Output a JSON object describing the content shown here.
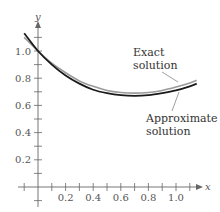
{
  "chart_data": {
    "type": "line",
    "title": "",
    "xlabel": "x",
    "ylabel": "y",
    "xlim": [
      -0.1,
      1.25
    ],
    "ylim": [
      -0.1,
      1.2
    ],
    "x_ticks": [
      0.2,
      0.4,
      0.6,
      0.8,
      1.0
    ],
    "x_tick_labels": [
      "0.2",
      "0.4",
      "0.6",
      "0.8",
      "1.0"
    ],
    "y_ticks": [
      0.2,
      0.4,
      0.6,
      0.8,
      1.0
    ],
    "y_tick_labels": [
      "0.2",
      "0.4",
      "0.6",
      "0.8",
      "1.0"
    ],
    "minor_tick_step": 0.1,
    "grid": false,
    "legend": null,
    "series": [
      {
        "name": "Exact solution",
        "color": "#9a9a9a",
        "x": [
          -0.1,
          0.0,
          0.1,
          0.2,
          0.3,
          0.4,
          0.5,
          0.6,
          0.7,
          0.8,
          0.9,
          1.0,
          1.1,
          1.15
        ],
        "y": [
          1.1,
          1.0,
          0.91,
          0.84,
          0.78,
          0.74,
          0.71,
          0.695,
          0.69,
          0.695,
          0.71,
          0.735,
          0.765,
          0.785
        ]
      },
      {
        "name": "Approximate solution",
        "color": "#1a1a1a",
        "x": [
          -0.1,
          0.0,
          0.1,
          0.2,
          0.3,
          0.4,
          0.5,
          0.6,
          0.7,
          0.8,
          0.9,
          1.0,
          1.1,
          1.15
        ],
        "y": [
          1.13,
          1.0,
          0.9,
          0.82,
          0.76,
          0.715,
          0.69,
          0.675,
          0.67,
          0.675,
          0.69,
          0.71,
          0.74,
          0.76
        ]
      }
    ],
    "annotations": [
      {
        "text_lines": [
          "Exact",
          "solution"
        ],
        "target_series": "Exact solution"
      },
      {
        "text_lines": [
          "Approximate",
          "solution"
        ],
        "target_series": "Approximate solution"
      }
    ]
  },
  "labels": {
    "x_axis": "x",
    "y_axis": "y",
    "annot_exact_1": "Exact",
    "annot_exact_2": "solution",
    "annot_approx_1": "Approximate",
    "annot_approx_2": "solution"
  }
}
